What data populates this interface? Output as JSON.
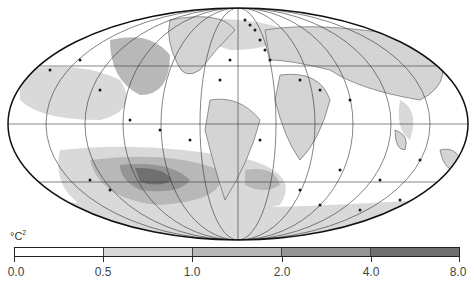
{
  "figure": {
    "type": "global map (Mollweide projection), Atlantic-centered",
    "projection_ellipse": {
      "cx": 238,
      "cy": 124,
      "rx": 230,
      "ry": 116
    }
  },
  "legend": {
    "unit": "°C²",
    "unit_base": "°C",
    "unit_exp": "2",
    "ticks": [
      "0.0",
      "0.5",
      "1.0",
      "2.0",
      "4.0",
      "8.0"
    ],
    "bins": [
      {
        "range": "0.0–0.5",
        "color": "#ffffff"
      },
      {
        "range": "0.5–1.0",
        "color": "#d9d9d9"
      },
      {
        "range": "1.0–2.0",
        "color": "#b8b8b8"
      },
      {
        "range": "2.0–4.0",
        "color": "#959595"
      },
      {
        "range": "4.0–8.0",
        "color": "#707070"
      }
    ]
  },
  "colors": {
    "land": "#d4d4d4",
    "graticule": "#333333",
    "dots": "#1a1a1a",
    "outline": "#111111"
  }
}
